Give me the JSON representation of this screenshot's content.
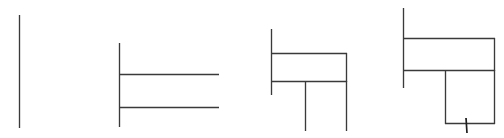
{
  "document": {
    "title": "Rectilinear Line Drawing Sequence",
    "background_color": "#ffffff",
    "ink_color": "#3a3a3a",
    "width": 504,
    "height": 138,
    "panel_count": 4,
    "description": "Four progressive stages of a rectilinear technical line sketch drawn in thin dark gray strokes on a plain white ground."
  },
  "panels": [
    {
      "id": "panel-1",
      "name": "single-vertical-stroke",
      "label": "Stage 1",
      "stroke_count": 1,
      "bounds": {
        "x": 0,
        "y": 0,
        "width": 100,
        "height": 138
      },
      "strokes": [
        {
          "name": "vertical-rule",
          "type": "line",
          "x1": 19.5,
          "y1": 15,
          "x2": 19.5,
          "y2": 128,
          "weight": "thin"
        }
      ]
    },
    {
      "id": "panel-2",
      "name": "vertical-with-two-horizontals",
      "label": "Stage 2",
      "stroke_count": 3,
      "bounds": {
        "x": 100,
        "y": 0,
        "width": 140,
        "height": 138
      },
      "strokes": [
        {
          "name": "spine-vertical",
          "type": "line",
          "x1": 119.5,
          "y1": 43,
          "x2": 119.5,
          "y2": 127,
          "weight": "thin"
        },
        {
          "name": "upper-horizontal",
          "type": "line",
          "x1": 119,
          "y1": 74.5,
          "x2": 219,
          "y2": 74.5,
          "weight": "thin"
        },
        {
          "name": "lower-horizontal",
          "type": "line",
          "x1": 119,
          "y1": 107.5,
          "x2": 219,
          "y2": 107.5,
          "weight": "thin"
        }
      ]
    },
    {
      "id": "panel-3",
      "name": "closed-box-with-two-legs",
      "label": "Stage 3",
      "stroke_count": 6,
      "bounds": {
        "x": 240,
        "y": 0,
        "width": 130,
        "height": 138
      },
      "strokes": [
        {
          "name": "spine-vertical",
          "type": "line",
          "x1": 271.5,
          "y1": 29,
          "x2": 271.5,
          "y2": 95,
          "weight": "thin"
        },
        {
          "name": "box-top-edge",
          "type": "line",
          "x1": 271,
          "y1": 53.5,
          "x2": 347,
          "y2": 53.5,
          "weight": "thin"
        },
        {
          "name": "box-bottom-edge",
          "type": "line",
          "x1": 271,
          "y1": 81.5,
          "x2": 347,
          "y2": 81.5,
          "weight": "thin"
        },
        {
          "name": "box-right-edge",
          "type": "line",
          "x1": 346.5,
          "y1": 53,
          "x2": 346.5,
          "y2": 82,
          "weight": "thin"
        },
        {
          "name": "center-leg",
          "type": "line",
          "x1": 305.5,
          "y1": 81,
          "x2": 305.5,
          "y2": 131,
          "weight": "thin"
        },
        {
          "name": "right-leg",
          "type": "line",
          "x1": 346.5,
          "y1": 81,
          "x2": 346.5,
          "y2": 131,
          "weight": "thin"
        }
      ]
    },
    {
      "id": "panel-4",
      "name": "stacked-boxes-with-tick",
      "label": "Stage 4",
      "stroke_count": 8,
      "bounds": {
        "x": 370,
        "y": 0,
        "width": 134,
        "height": 138
      },
      "strokes": [
        {
          "name": "spine-vertical",
          "type": "line",
          "x1": 403.5,
          "y1": 8,
          "x2": 403.5,
          "y2": 88,
          "weight": "thin"
        },
        {
          "name": "upper-box-top-edge",
          "type": "line",
          "x1": 403,
          "y1": 38.5,
          "x2": 495,
          "y2": 38.5,
          "weight": "thin"
        },
        {
          "name": "upper-box-bottom-edge",
          "type": "line",
          "x1": 403,
          "y1": 70.5,
          "x2": 495,
          "y2": 70.5,
          "weight": "thin"
        },
        {
          "name": "upper-box-right-edge",
          "type": "line",
          "x1": 494.5,
          "y1": 38,
          "x2": 494.5,
          "y2": 71,
          "weight": "thin"
        },
        {
          "name": "lower-box-left-edge",
          "type": "line",
          "x1": 445.5,
          "y1": 70,
          "x2": 445.5,
          "y2": 124,
          "weight": "thin"
        },
        {
          "name": "lower-box-right-edge",
          "type": "line",
          "x1": 494.5,
          "y1": 70,
          "x2": 494.5,
          "y2": 124,
          "weight": "thin"
        },
        {
          "name": "lower-box-bottom-edge",
          "type": "line",
          "x1": 445,
          "y1": 123.5,
          "x2": 495,
          "y2": 123.5,
          "weight": "thin"
        },
        {
          "name": "bottom-tick-mark",
          "type": "line",
          "x1": 466,
          "y1": 118,
          "x2": 467,
          "y2": 133,
          "weight": "tick"
        }
      ]
    }
  ]
}
